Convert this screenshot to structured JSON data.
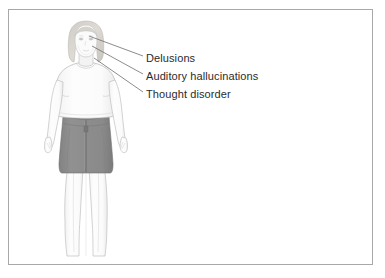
{
  "page": {
    "background_color": "#ffffff",
    "border_color": "#a8a8a8"
  },
  "illustration": {
    "subject": "standing female figure, front view, medical illustration",
    "skin_color": "#fafafa",
    "outline_color": "#b9b9b9",
    "hair_color": "#d9d6d0",
    "top_color": "#fdfdfd",
    "skirt_color": "#8b8b8b",
    "skirt_shadow_color": "#7c7c7c",
    "leader_line_color": "#6f6f6f"
  },
  "labels": [
    {
      "id": "delusions",
      "text": "Delusions",
      "anchor_x": 90,
      "anchor_y": 36
    },
    {
      "id": "auditory",
      "text": "Auditory hallucinations",
      "anchor_x": 92,
      "anchor_y": 46
    },
    {
      "id": "thought",
      "text": "Thought disorder",
      "anchor_x": 94,
      "anchor_y": 58
    }
  ],
  "text_color": "#2b2b2b"
}
